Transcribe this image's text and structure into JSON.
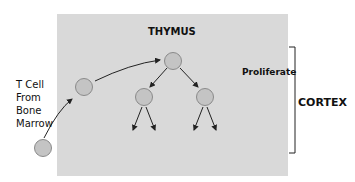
{
  "title": "THYMUS",
  "source_label": [
    "T Cell",
    "From",
    "Bone",
    "Marrow"
  ],
  "stage_label": "Proliferate",
  "region_label": "CORTEX",
  "colors": {
    "box": "#d9d9d9",
    "cell_fill": "#c4c4c4",
    "cell_stroke": "#8a8a8a",
    "arrow": "#222222"
  }
}
